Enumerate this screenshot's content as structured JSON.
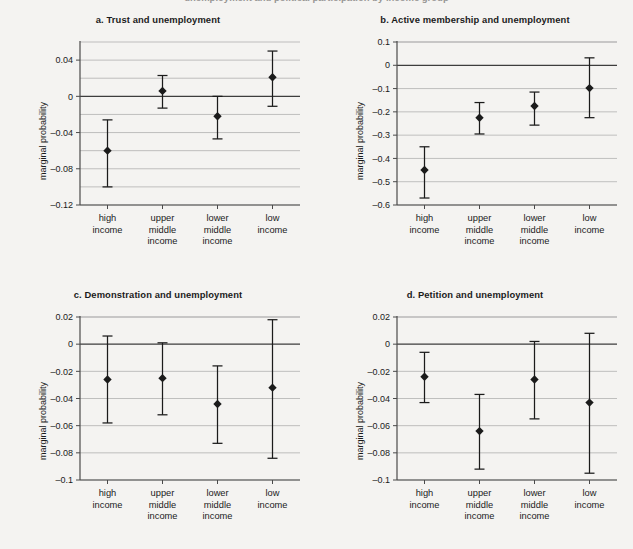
{
  "figure": {
    "cropped_header": "unemployment and political participation by income group",
    "background": "#f4f3f1",
    "ink": "#1b1b1b"
  },
  "shared": {
    "ylabel": "marginal probability",
    "categories": [
      "high\nincome",
      "upper\nmiddle\nincome",
      "lower\nmiddle\nincome",
      "low\nincome"
    ],
    "category_lines": [
      [
        "high",
        "income"
      ],
      [
        "upper",
        "middle",
        "income"
      ],
      [
        "lower",
        "middle",
        "income"
      ],
      [
        "low",
        "income"
      ]
    ]
  },
  "chart_data": [
    {
      "id": "panel-a",
      "type": "scatter",
      "title": "a.  Trust and unemployment",
      "letter": "a.",
      "name": "Trust and unemployment",
      "xlabel": "",
      "ylabel": "marginal probability",
      "categories": [
        "high income",
        "upper middle income",
        "lower middle income",
        "low income"
      ],
      "values": [
        -0.06,
        0.006,
        -0.022,
        0.021
      ],
      "ci_low": [
        -0.1,
        -0.013,
        -0.047,
        -0.011
      ],
      "ci_high": [
        -0.026,
        0.023,
        0.0,
        0.05
      ],
      "ylim": [
        -0.12,
        0.06
      ],
      "ytick_labels": [
        "0.04",
        "0",
        "-0.04",
        "-0.08",
        "-0.12"
      ],
      "ytick_values": [
        0.04,
        0,
        -0.04,
        -0.08,
        -0.12
      ],
      "gridline_values": [
        0.04,
        0.02,
        0,
        -0.02,
        -0.04,
        -0.06,
        -0.08,
        -0.1,
        -0.12
      ],
      "grid": true,
      "zero_line": 0,
      "legend": "none"
    },
    {
      "id": "panel-b",
      "type": "scatter",
      "title": "b.  Active membership and unemployment",
      "letter": "b.",
      "name": "Active membership and unemployment",
      "xlabel": "",
      "ylabel": "marginal probability",
      "categories": [
        "high income",
        "upper middle income",
        "lower middle income",
        "low income"
      ],
      "values": [
        -0.45,
        -0.225,
        -0.175,
        -0.098
      ],
      "ci_low": [
        -0.57,
        -0.295,
        -0.257,
        -0.225
      ],
      "ci_high": [
        -0.35,
        -0.16,
        -0.115,
        0.032
      ],
      "ylim": [
        -0.6,
        0.1
      ],
      "ytick_labels": [
        "0.1",
        "0",
        "-0.1",
        "-0.2",
        "-0.3",
        "-0.4",
        "-0.5",
        "-0.6"
      ],
      "ytick_values": [
        0.1,
        0,
        -0.1,
        -0.2,
        -0.3,
        -0.4,
        -0.5,
        -0.6
      ],
      "gridline_values": [
        0.1,
        0,
        -0.1,
        -0.2,
        -0.3,
        -0.4,
        -0.5,
        -0.6
      ],
      "grid": true,
      "zero_line": 0,
      "legend": "none"
    },
    {
      "id": "panel-c",
      "type": "scatter",
      "title": "c.  Demonstration and unemployment",
      "letter": "c.",
      "name": "Demonstration and unemployment",
      "xlabel": "",
      "ylabel": "marginal probability",
      "categories": [
        "high income",
        "upper middle income",
        "lower middle income",
        "low income"
      ],
      "values": [
        -0.026,
        -0.025,
        -0.044,
        -0.032
      ],
      "ci_low": [
        -0.058,
        -0.052,
        -0.073,
        -0.084
      ],
      "ci_high": [
        0.006,
        0.001,
        -0.016,
        0.018
      ],
      "ylim": [
        -0.1,
        0.02
      ],
      "ytick_labels": [
        "0.02",
        "0",
        "-0.02",
        "-0.04",
        "-0.06",
        "-0.08",
        "-0.1"
      ],
      "ytick_values": [
        0.02,
        0,
        -0.02,
        -0.04,
        -0.06,
        -0.08,
        -0.1
      ],
      "gridline_values": [
        0.02,
        0,
        -0.02,
        -0.04,
        -0.06,
        -0.08,
        -0.1
      ],
      "grid": true,
      "zero_line": 0,
      "legend": "none"
    },
    {
      "id": "panel-d",
      "type": "scatter",
      "title": "d.  Petition and unemployment",
      "letter": "d.",
      "name": "Petition and unemployment",
      "xlabel": "",
      "ylabel": "marginal probability",
      "categories": [
        "high income",
        "upper middle income",
        "lower middle income",
        "low income"
      ],
      "values": [
        -0.024,
        -0.064,
        -0.026,
        -0.043
      ],
      "ci_low": [
        -0.043,
        -0.092,
        -0.055,
        -0.095
      ],
      "ci_high": [
        -0.006,
        -0.037,
        0.002,
        0.008
      ],
      "ylim": [
        -0.1,
        0.02
      ],
      "ytick_labels": [
        "0.02",
        "0",
        "-0.02",
        "-0.04",
        "-0.06",
        "-0.08",
        "-0.1"
      ],
      "ytick_values": [
        0.02,
        0,
        -0.02,
        -0.04,
        -0.06,
        -0.08,
        -0.1
      ],
      "gridline_values": [
        0.02,
        0,
        -0.02,
        -0.04,
        -0.06,
        -0.08,
        -0.1
      ],
      "grid": true,
      "zero_line": 0,
      "legend": "none"
    }
  ]
}
